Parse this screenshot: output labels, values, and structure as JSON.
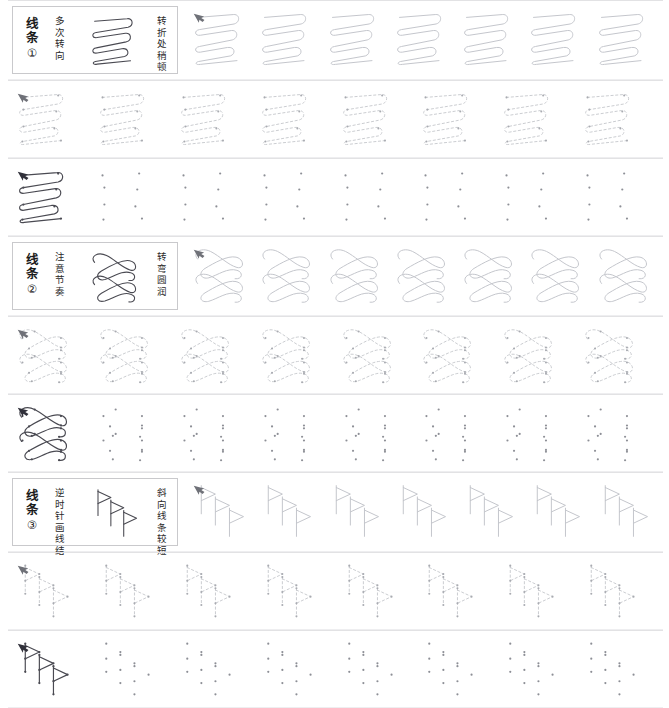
{
  "page": {
    "background": "#ffffff",
    "ink_dark": "#4a4a52",
    "ink_trace": "#c3c5cb",
    "ink_dot": "#8d8f96",
    "rule_color": "#e2e2e4",
    "box_border": "#c9c9cc"
  },
  "sections": [
    {
      "id": "line-1",
      "label": "线条",
      "number": "①",
      "note_left": "多次转向",
      "note_right": "转折处稍顿",
      "glyph": "zigzag-loop",
      "rows": [
        {
          "hint": "trace",
          "count": 7,
          "model": false
        },
        {
          "hint": "dash",
          "count": 8,
          "model": false
        },
        {
          "hint": "dots",
          "count": 8,
          "model": true
        }
      ]
    },
    {
      "id": "line-2",
      "label": "线条",
      "number": "②",
      "note_left": "注意节奏",
      "note_right": "转弯圆润",
      "glyph": "bowtie-loops",
      "rows": [
        {
          "hint": "trace",
          "count": 7,
          "model": false
        },
        {
          "hint": "dash",
          "count": 8,
          "model": false
        },
        {
          "hint": "dots",
          "count": 8,
          "model": true
        }
      ]
    },
    {
      "id": "line-3",
      "label": "线条",
      "number": "③",
      "note_left": "逆时针画线结",
      "note_right": "斜向线条较短",
      "glyph": "flag-stems",
      "rows": [
        {
          "hint": "trace",
          "count": 7,
          "model": false
        },
        {
          "hint": "dash",
          "count": 8,
          "model": false
        },
        {
          "hint": "dots",
          "count": 8,
          "model": true
        }
      ]
    }
  ]
}
